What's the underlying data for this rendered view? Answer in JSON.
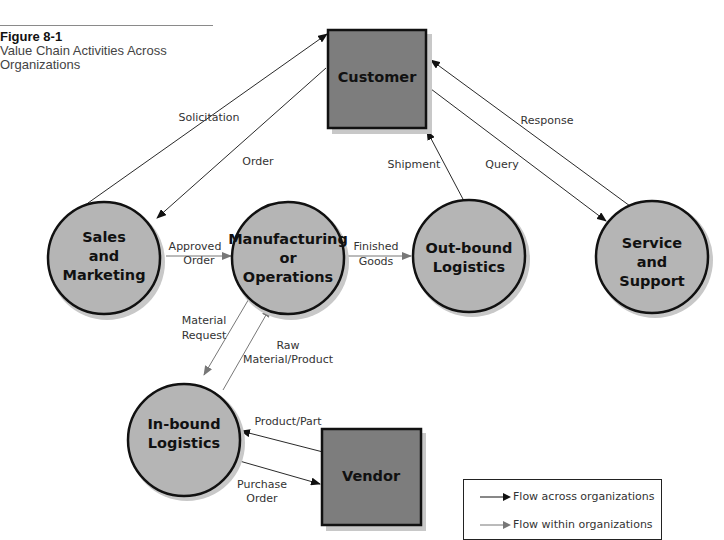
{
  "caption": {
    "figure_number": "Figure 8-1",
    "title_line1": "Value Chain Activities Across",
    "title_line2": "Organizations"
  },
  "nodes": {
    "customer": {
      "shape": "square",
      "label": "Customer"
    },
    "vendor": {
      "shape": "square",
      "label": "Vendor"
    },
    "sales": {
      "shape": "circle",
      "lines": [
        "Sales",
        "and",
        "Marketing"
      ]
    },
    "manufacturing": {
      "shape": "circle",
      "lines": [
        "Manufacturing",
        "or",
        "Operations"
      ]
    },
    "outbound": {
      "shape": "circle",
      "lines": [
        "Out-bound",
        "Logistics"
      ]
    },
    "service": {
      "shape": "circle",
      "lines": [
        "Service",
        "and",
        "Support"
      ]
    },
    "inbound": {
      "shape": "circle",
      "lines": [
        "In-bound",
        "Logistics"
      ]
    }
  },
  "edges": [
    {
      "from": "sales",
      "to": "customer",
      "label": "Solicitation",
      "type": "across"
    },
    {
      "from": "customer",
      "to": "sales",
      "label": "Order",
      "type": "across"
    },
    {
      "from": "outbound",
      "to": "customer",
      "label": "Shipment",
      "type": "across"
    },
    {
      "from": "customer",
      "to": "service",
      "label": "Query",
      "type": "across"
    },
    {
      "from": "service",
      "to": "customer",
      "label": "Response",
      "type": "across"
    },
    {
      "from": "sales",
      "to": "manufacturing",
      "label_lines": [
        "Approved",
        "Order"
      ],
      "type": "within"
    },
    {
      "from": "manufacturing",
      "to": "outbound",
      "label_lines": [
        "Finished",
        "Goods"
      ],
      "type": "within"
    },
    {
      "from": "manufacturing",
      "to": "inbound",
      "label_lines": [
        "Material",
        "Request"
      ],
      "type": "within"
    },
    {
      "from": "inbound",
      "to": "manufacturing",
      "label_lines": [
        "Raw",
        "Material/Product"
      ],
      "type": "within"
    },
    {
      "from": "vendor",
      "to": "inbound",
      "label": "Product/Part",
      "type": "across"
    },
    {
      "from": "inbound",
      "to": "vendor",
      "label_lines": [
        "Purchase",
        "Order"
      ],
      "type": "across"
    }
  ],
  "legend": {
    "items": [
      {
        "label": "Flow across organizations",
        "color": "#111111"
      },
      {
        "label": "Flow within organizations",
        "color": "#777777"
      }
    ]
  },
  "colors": {
    "square_fill": "#7d7d7d",
    "circle_fill": "#b5b5b5",
    "across_arrow": "#111111",
    "within_arrow": "#777777",
    "shadow": "#c8c8c8"
  }
}
